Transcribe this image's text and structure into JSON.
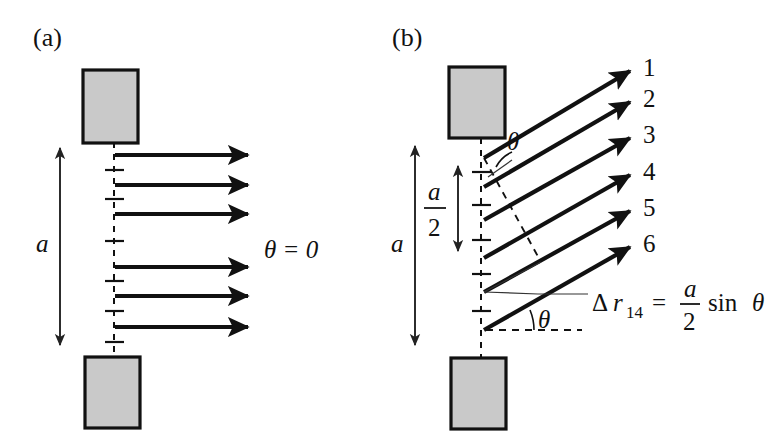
{
  "figure": {
    "title_panel_a": "(a)",
    "title_panel_b": "(b)",
    "background_color": "#ffffff",
    "block_fill_color": "#c9c9c9",
    "line_color": "#111111"
  },
  "panel_a": {
    "label": "(a)",
    "slit_width_label": "a",
    "angle_label": "θ = 0",
    "ray_count": 6,
    "blocks": [
      {
        "name": "upper-barrier",
        "x": 83,
        "y": 70,
        "width": 55,
        "height": 73
      },
      {
        "name": "lower-barrier",
        "x": 85,
        "y": 357,
        "width": 55,
        "height": 71
      }
    ],
    "rays": [
      {
        "id": 1,
        "y": 155,
        "x_start": 115,
        "x_end": 252
      },
      {
        "id": 2,
        "y": 185,
        "x_start": 115,
        "x_end": 252
      },
      {
        "id": 3,
        "y": 214,
        "x_start": 115,
        "x_end": 252
      },
      {
        "id": 4,
        "y": 267,
        "x_start": 115,
        "x_end": 252
      },
      {
        "id": 5,
        "y": 296,
        "x_start": 115,
        "x_end": 252
      },
      {
        "id": 6,
        "y": 327,
        "x_start": 115,
        "x_end": 252
      }
    ],
    "slit_line": {
      "x": 114,
      "y_top": 143,
      "y_bottom": 357
    },
    "tick_positions": [
      170,
      199,
      241,
      281,
      311,
      342
    ],
    "dimension_a": {
      "x": 60,
      "y_top": 143,
      "y_bottom": 350,
      "label_x": 44,
      "label_y": 243
    },
    "angle_text_pos": {
      "x": 264,
      "y": 250
    }
  },
  "panel_b": {
    "label": "(b)",
    "slit_width_label": "a",
    "half_width_numerator": "a",
    "half_width_denominator": "2",
    "angle_label_top": "θ",
    "angle_label_bottom": "θ",
    "path_difference": {
      "delta": "Δ",
      "symbol": "r",
      "subscript": "14",
      "equals": "=",
      "numerator": "a",
      "denominator": "2",
      "trig": "sin",
      "angle": "θ"
    },
    "ray_angle_degrees": 30,
    "ray_labels": [
      "1",
      "2",
      "3",
      "4",
      "5",
      "6"
    ],
    "blocks": [
      {
        "name": "upper-barrier",
        "x": 449,
        "y": 67,
        "width": 56,
        "height": 71
      },
      {
        "name": "lower-barrier",
        "x": 451,
        "y": 358,
        "width": 55,
        "height": 71
      }
    ],
    "rays": [
      {
        "id": 1,
        "x_start": 484,
        "y_start": 158,
        "x_end": 634,
        "y_end": 69,
        "label_x": 643,
        "label_y": 75
      },
      {
        "id": 2,
        "x_start": 484,
        "y_start": 187,
        "x_end": 634,
        "y_end": 100,
        "label_x": 643,
        "label_y": 106
      },
      {
        "id": 3,
        "x_start": 484,
        "y_start": 220,
        "x_end": 634,
        "y_end": 136,
        "label_x": 643,
        "label_y": 142
      },
      {
        "id": 4,
        "x_start": 484,
        "y_start": 258,
        "x_end": 634,
        "y_end": 173,
        "label_x": 643,
        "label_y": 179
      },
      {
        "id": 5,
        "x_start": 484,
        "y_start": 292,
        "x_end": 634,
        "y_end": 209,
        "label_x": 643,
        "label_y": 215
      },
      {
        "id": 6,
        "x_start": 484,
        "y_start": 330,
        "x_end": 634,
        "y_end": 245,
        "label_x": 643,
        "label_y": 251
      }
    ],
    "slit_line": {
      "x": 481,
      "y_top": 138,
      "y_bottom": 358
    },
    "tick_positions": [
      172,
      205,
      240,
      274,
      311
    ],
    "dimension_a": {
      "x": 415,
      "y_top": 140,
      "y_bottom": 350,
      "label_x": 398,
      "label_y": 243
    },
    "dimension_half_a": {
      "x": 458,
      "y_top": 160,
      "y_bottom": 256,
      "label_x": 434,
      "label_y": 205
    },
    "baseline_dash": {
      "x_start": 486,
      "y": 330,
      "x_end": 582,
      "y_end": 330
    },
    "perpendicular_dash": {
      "x_start": 484,
      "y_start": 158,
      "x_end": 541,
      "y_end": 262
    },
    "angle_top_pos": {
      "x": 505,
      "y": 152
    },
    "angle_bottom_pos": {
      "x": 538,
      "y": 327
    },
    "formula_pos": {
      "x": 592,
      "y": 303
    }
  }
}
